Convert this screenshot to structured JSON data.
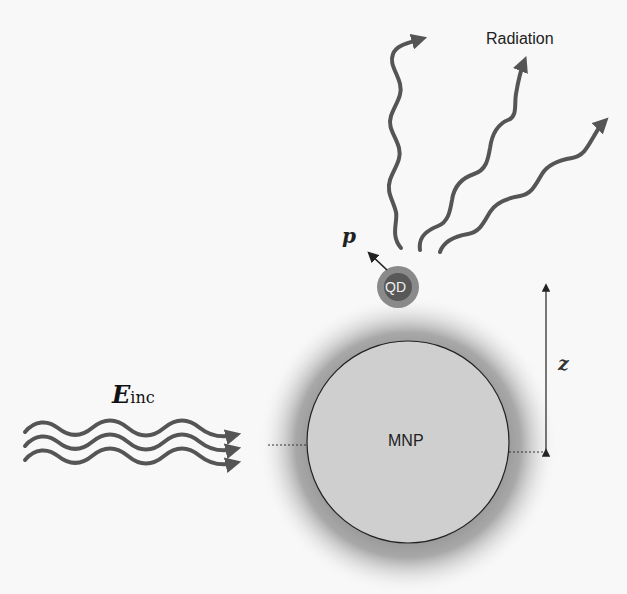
{
  "diagram": {
    "labels": {
      "radiation": "Radiation",
      "dipole": "p",
      "quantum_dot": "QD",
      "separation": "z",
      "incident_field_main": "E",
      "incident_field_sub": "inc",
      "nanoparticle": "MNP"
    },
    "colors": {
      "background": "#f8f8f8",
      "wave_stroke": "#555555",
      "mnp_fill": "#cfcfcf",
      "mnp_glow": "#8c8c8c",
      "qd_outer": "#8a8a8a",
      "qd_inner": "#585858",
      "line": "#222222"
    }
  }
}
